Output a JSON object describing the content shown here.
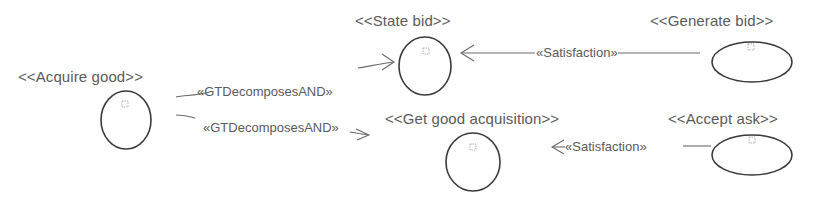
{
  "diagram": {
    "nodes": [
      {
        "id": "acquire-good",
        "label": "<<Acquire good>>",
        "shape": "circle"
      },
      {
        "id": "state-bid",
        "label": "<<State bid>>",
        "shape": "circle"
      },
      {
        "id": "get-good-acquisition",
        "label": "<<Get good acquisition>>",
        "shape": "circle"
      },
      {
        "id": "generate-bid",
        "label": "<<Generate bid>>",
        "shape": "ellipse"
      },
      {
        "id": "accept-ask",
        "label": "<<Accept ask>>",
        "shape": "ellipse"
      }
    ],
    "edges": [
      {
        "from": "acquire-good",
        "to": "state-bid",
        "label": "«GTDecomposesAND»"
      },
      {
        "from": "acquire-good",
        "to": "get-good-acquisition",
        "label": "«GTDecomposesAND»"
      },
      {
        "from": "generate-bid",
        "to": "state-bid",
        "label": "«Satisfaction»"
      },
      {
        "from": "accept-ask",
        "to": "get-good-acquisition",
        "label": "«Satisfaction»"
      }
    ]
  },
  "colors": {
    "background": "#ffffff",
    "stroke": "#3a3a3a",
    "text": "#5a5a5a"
  }
}
